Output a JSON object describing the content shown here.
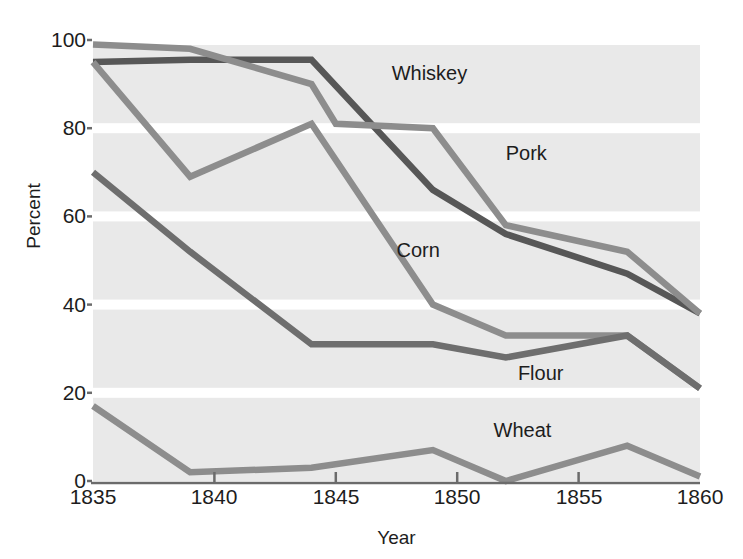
{
  "chart_data": {
    "type": "line",
    "title": "",
    "xlabel": "Year",
    "ylabel": "Percent",
    "xlim": [
      1835,
      1860
    ],
    "ylim": [
      0,
      100
    ],
    "grid": "horizontal-banded",
    "legend_position": "inline-labels",
    "xticks": [
      1835,
      1840,
      1845,
      1850,
      1855,
      1860
    ],
    "yticks": [
      0,
      20,
      40,
      60,
      80,
      100
    ],
    "series": [
      {
        "name": "Whiskey",
        "color": "#575757",
        "x": [
          1835,
          1839,
          1844,
          1849,
          1852,
          1857,
          1860
        ],
        "values": [
          95,
          95.5,
          95.5,
          66,
          56,
          47,
          38
        ]
      },
      {
        "name": "Pork",
        "color": "#8d8d8d",
        "x": [
          1835,
          1839,
          1844,
          1845,
          1849,
          1852,
          1857,
          1860
        ],
        "values": [
          99,
          98,
          90,
          81,
          80,
          58,
          52,
          38
        ]
      },
      {
        "name": "Corn",
        "color": "#8d8d8d",
        "x": [
          1835,
          1839,
          1844,
          1849,
          1852,
          1857,
          1860
        ],
        "values": [
          95,
          69,
          81,
          40,
          33,
          33,
          21
        ]
      },
      {
        "name": "Flour",
        "color": "#6e6e6e",
        "x": [
          1835,
          1839,
          1844,
          1849,
          1852,
          1857,
          1860
        ],
        "values": [
          70,
          52,
          31,
          31,
          28,
          33,
          21
        ]
      },
      {
        "name": "Wheat",
        "color": "#8d8d8d",
        "x": [
          1835,
          1839,
          1844,
          1849,
          1852,
          1857,
          1860
        ],
        "values": [
          17,
          2,
          3,
          7,
          0,
          8,
          1
        ]
      }
    ],
    "series_labels": [
      {
        "text": "Whiskey",
        "x": 1847.3,
        "y": 92
      },
      {
        "text": "Pork",
        "x": 1852.0,
        "y": 74
      },
      {
        "text": "Corn",
        "x": 1847.5,
        "y": 52
      },
      {
        "text": "Flour",
        "x": 1852.5,
        "y": 24
      },
      {
        "text": "Wheat",
        "x": 1851.5,
        "y": 11
      }
    ]
  },
  "axis": {
    "ylabel": "Percent",
    "xlabel": "Year",
    "ytick_labels": [
      "100",
      "80",
      "60",
      "40",
      "20",
      "0"
    ],
    "xtick_labels": [
      "1835",
      "1840",
      "1845",
      "1850",
      "1855",
      "1860"
    ]
  },
  "colors": {
    "plot_background": "#e9e9e9",
    "band_separator": "#ffffff",
    "axis": "#6b6b6b",
    "text": "#1d1d1d"
  }
}
